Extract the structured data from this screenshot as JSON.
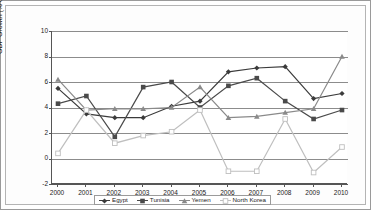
{
  "chart_data": {
    "type": "line",
    "title": "",
    "xlabel": "",
    "ylabel": "GDP Growth (% change)",
    "categories": [
      "2000",
      "2001",
      "2002",
      "2003",
      "2004",
      "2005",
      "2006",
      "2007",
      "2008",
      "2009",
      "2010"
    ],
    "ylim": [
      -2,
      10
    ],
    "yticks": [
      -2,
      0,
      2,
      4,
      6,
      8,
      10
    ],
    "ytick_labels": [
      "-2",
      "0",
      "2",
      "4",
      "6",
      "8",
      "10"
    ],
    "grid": true,
    "legend_position": "bottom",
    "series": [
      {
        "name": "Egypt",
        "marker": "diamond",
        "color": "#3b3b3b",
        "values": [
          5.5,
          3.5,
          3.2,
          3.2,
          4.1,
          4.5,
          6.8,
          7.1,
          7.2,
          4.7,
          5.1
        ]
      },
      {
        "name": "Tunisia",
        "marker": "square",
        "color": "#4a4a4a",
        "values": [
          4.3,
          4.9,
          1.7,
          5.6,
          6.0,
          4.0,
          5.7,
          6.3,
          4.5,
          3.1,
          3.8
        ]
      },
      {
        "name": "Yemen",
        "marker": "triangle",
        "color": "#8a8a8a",
        "values": [
          6.2,
          3.8,
          3.9,
          3.9,
          4.0,
          5.6,
          3.2,
          3.3,
          3.6,
          3.9,
          8.0
        ]
      },
      {
        "name": "North Korea",
        "marker": "open-square",
        "color": "#bfbfbf",
        "values": [
          0.4,
          3.8,
          1.2,
          1.8,
          2.1,
          3.8,
          -1.0,
          -1.0,
          3.1,
          -1.1,
          0.9
        ]
      }
    ]
  },
  "axis": {
    "ylabel": "GDP Growth (% change)"
  },
  "legend": {
    "items": [
      {
        "label": "Egypt"
      },
      {
        "label": "Tunisia"
      },
      {
        "label": "Yemen"
      },
      {
        "label": "North Korea"
      }
    ]
  }
}
